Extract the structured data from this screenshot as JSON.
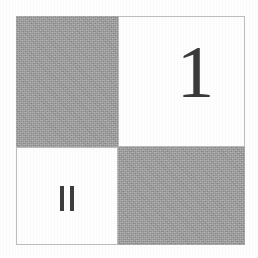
{
  "figure": {
    "type": "checkerboard-diagram",
    "background_color": "#ffffff",
    "gray_color": "#9c9c9c",
    "white_color": "#ffffff",
    "border_color": "#bdbdbd",
    "glyph_color": "#3d3d3d",
    "cells": [
      {
        "position": "top-left",
        "fill": "gray",
        "label": ""
      },
      {
        "position": "top-right",
        "fill": "white",
        "label": "1"
      },
      {
        "position": "bottom-left",
        "fill": "white",
        "label": "II"
      },
      {
        "position": "bottom-right",
        "fill": "gray",
        "label": ""
      }
    ],
    "numeral_one": "1",
    "numeral_two_bar_count": 2
  }
}
